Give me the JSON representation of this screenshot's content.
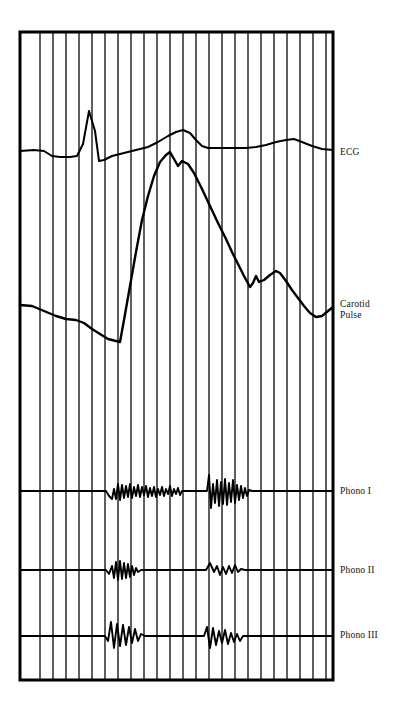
{
  "figure": {
    "kind": "phonocardiogram-recording",
    "background_color": "#ffffff",
    "ink_color": "#000000",
    "frame": {
      "x": 20,
      "y": 32,
      "width": 313,
      "height": 648,
      "border_width": 3,
      "border_color": "#000000"
    },
    "grid": {
      "orientation": "vertical",
      "line_color": "#1a1a1a",
      "line_width": 1.4,
      "count": 23,
      "x_positions": [
        40,
        53,
        66,
        79,
        92,
        105,
        118,
        131,
        144,
        157,
        170,
        183,
        196,
        209,
        222,
        235,
        248,
        261,
        274,
        287,
        300,
        313,
        326
      ]
    }
  },
  "traces": [
    {
      "id": "ecg",
      "label": "ECG",
      "label_lines": "ECG",
      "baseline_y": 152,
      "stroke_width": 2.0,
      "points": [
        [
          20,
          151
        ],
        [
          34,
          150
        ],
        [
          44,
          151
        ],
        [
          52,
          156
        ],
        [
          60,
          157
        ],
        [
          70,
          157
        ],
        [
          77,
          156
        ],
        [
          83,
          144
        ],
        [
          89,
          111
        ],
        [
          95,
          131
        ],
        [
          99,
          161
        ],
        [
          104,
          160
        ],
        [
          112,
          156
        ],
        [
          124,
          153
        ],
        [
          136,
          150
        ],
        [
          148,
          147
        ],
        [
          158,
          142
        ],
        [
          168,
          136
        ],
        [
          176,
          132
        ],
        [
          183,
          130
        ],
        [
          190,
          133
        ],
        [
          196,
          140
        ],
        [
          202,
          146
        ],
        [
          208,
          148
        ],
        [
          216,
          148
        ],
        [
          226,
          148
        ],
        [
          236,
          148
        ],
        [
          246,
          148
        ],
        [
          256,
          147
        ],
        [
          266,
          145
        ],
        [
          276,
          142
        ],
        [
          286,
          140
        ],
        [
          294,
          139
        ],
        [
          302,
          142
        ],
        [
          312,
          146
        ],
        [
          322,
          149
        ],
        [
          333,
          150
        ]
      ]
    },
    {
      "id": "carotid-pulse",
      "label": "Carotid Pulse",
      "label_lines": "Carotid\nPulse",
      "baseline_y": 305,
      "stroke_width": 2.4,
      "points": [
        [
          20,
          305
        ],
        [
          32,
          306
        ],
        [
          44,
          311
        ],
        [
          56,
          316
        ],
        [
          66,
          319
        ],
        [
          76,
          320
        ],
        [
          84,
          323
        ],
        [
          92,
          329
        ],
        [
          100,
          334
        ],
        [
          108,
          339
        ],
        [
          116,
          341
        ],
        [
          120,
          342
        ],
        [
          124,
          320
        ],
        [
          130,
          286
        ],
        [
          136,
          252
        ],
        [
          142,
          220
        ],
        [
          148,
          196
        ],
        [
          154,
          176
        ],
        [
          160,
          162
        ],
        [
          166,
          155
        ],
        [
          170,
          152
        ],
        [
          174,
          159
        ],
        [
          178,
          166
        ],
        [
          182,
          161
        ],
        [
          188,
          164
        ],
        [
          194,
          173
        ],
        [
          202,
          189
        ],
        [
          210,
          206
        ],
        [
          218,
          223
        ],
        [
          226,
          239
        ],
        [
          232,
          252
        ],
        [
          238,
          264
        ],
        [
          244,
          276
        ],
        [
          250,
          287
        ],
        [
          253,
          283
        ],
        [
          256,
          276
        ],
        [
          259,
          282
        ],
        [
          264,
          280
        ],
        [
          270,
          275
        ],
        [
          276,
          271
        ],
        [
          280,
          273
        ],
        [
          286,
          281
        ],
        [
          292,
          290
        ],
        [
          298,
          298
        ],
        [
          304,
          306
        ],
        [
          310,
          313
        ],
        [
          316,
          317
        ],
        [
          322,
          316
        ],
        [
          328,
          311
        ],
        [
          333,
          307
        ]
      ]
    },
    {
      "id": "phono-i",
      "label": "Phono I",
      "label_lines": "Phono I",
      "baseline_y": 491,
      "stroke_width": 1.9,
      "points": [
        [
          20,
          491
        ],
        [
          100,
          491
        ],
        [
          106,
          491
        ],
        [
          109,
          496
        ],
        [
          112,
          499
        ],
        [
          114,
          489
        ],
        [
          116,
          499
        ],
        [
          118,
          484
        ],
        [
          120,
          500
        ],
        [
          122,
          485
        ],
        [
          124,
          498
        ],
        [
          126,
          486
        ],
        [
          128,
          497
        ],
        [
          130,
          484
        ],
        [
          132,
          498
        ],
        [
          134,
          487
        ],
        [
          136,
          496
        ],
        [
          138,
          485
        ],
        [
          140,
          497
        ],
        [
          142,
          487
        ],
        [
          144,
          495
        ],
        [
          146,
          486
        ],
        [
          148,
          497
        ],
        [
          150,
          488
        ],
        [
          152,
          496
        ],
        [
          154,
          487
        ],
        [
          156,
          497
        ],
        [
          158,
          489
        ],
        [
          160,
          495
        ],
        [
          162,
          487
        ],
        [
          164,
          496
        ],
        [
          166,
          489
        ],
        [
          168,
          494
        ],
        [
          170,
          486
        ],
        [
          172,
          496
        ],
        [
          174,
          489
        ],
        [
          176,
          494
        ],
        [
          178,
          488
        ],
        [
          180,
          495
        ],
        [
          182,
          491
        ],
        [
          185,
          491
        ],
        [
          196,
          491
        ],
        [
          203,
          491
        ],
        [
          207,
          491
        ],
        [
          209,
          475
        ],
        [
          211,
          508
        ],
        [
          213,
          484
        ],
        [
          215,
          503
        ],
        [
          217,
          480
        ],
        [
          219,
          506
        ],
        [
          221,
          482
        ],
        [
          223,
          504
        ],
        [
          225,
          479
        ],
        [
          227,
          505
        ],
        [
          229,
          483
        ],
        [
          231,
          502
        ],
        [
          233,
          480
        ],
        [
          235,
          503
        ],
        [
          237,
          485
        ],
        [
          239,
          500
        ],
        [
          241,
          486
        ],
        [
          243,
          498
        ],
        [
          245,
          488
        ],
        [
          247,
          496
        ],
        [
          249,
          490
        ],
        [
          252,
          491
        ],
        [
          262,
          491
        ],
        [
          333,
          491
        ]
      ]
    },
    {
      "id": "phono-ii",
      "label": "Phono II",
      "label_lines": "Phono II",
      "baseline_y": 570,
      "stroke_width": 1.9,
      "points": [
        [
          20,
          570
        ],
        [
          100,
          570
        ],
        [
          106,
          570
        ],
        [
          109,
          574
        ],
        [
          112,
          566
        ],
        [
          114,
          578
        ],
        [
          116,
          562
        ],
        [
          118,
          580
        ],
        [
          120,
          561
        ],
        [
          122,
          579
        ],
        [
          124,
          563
        ],
        [
          126,
          578
        ],
        [
          128,
          564
        ],
        [
          130,
          577
        ],
        [
          132,
          566
        ],
        [
          134,
          575
        ],
        [
          136,
          568
        ],
        [
          138,
          572
        ],
        [
          141,
          570
        ],
        [
          150,
          570
        ],
        [
          200,
          570
        ],
        [
          206,
          570
        ],
        [
          210,
          563
        ],
        [
          214,
          572
        ],
        [
          217,
          566
        ],
        [
          220,
          575
        ],
        [
          223,
          567
        ],
        [
          226,
          574
        ],
        [
          229,
          566
        ],
        [
          232,
          573
        ],
        [
          235,
          565
        ],
        [
          238,
          572
        ],
        [
          241,
          569
        ],
        [
          245,
          570
        ],
        [
          256,
          570
        ],
        [
          333,
          570
        ]
      ]
    },
    {
      "id": "phono-iii",
      "label": "Phono III",
      "label_lines": "Phono III",
      "baseline_y": 636,
      "stroke_width": 1.9,
      "points": [
        [
          20,
          636
        ],
        [
          100,
          636
        ],
        [
          105,
          636
        ],
        [
          108,
          641
        ],
        [
          111,
          622
        ],
        [
          114,
          648
        ],
        [
          117,
          624
        ],
        [
          120,
          646
        ],
        [
          123,
          625
        ],
        [
          126,
          645
        ],
        [
          129,
          627
        ],
        [
          132,
          643
        ],
        [
          135,
          629
        ],
        [
          138,
          641
        ],
        [
          141,
          634
        ],
        [
          145,
          636
        ],
        [
          154,
          636
        ],
        [
          198,
          636
        ],
        [
          204,
          636
        ],
        [
          207,
          627
        ],
        [
          210,
          648
        ],
        [
          213,
          628
        ],
        [
          216,
          645
        ],
        [
          219,
          631
        ],
        [
          222,
          643
        ],
        [
          225,
          630
        ],
        [
          228,
          644
        ],
        [
          231,
          633
        ],
        [
          234,
          642
        ],
        [
          237,
          634
        ],
        [
          240,
          641
        ],
        [
          243,
          636
        ],
        [
          248,
          636
        ],
        [
          260,
          636
        ],
        [
          333,
          636
        ]
      ]
    }
  ]
}
